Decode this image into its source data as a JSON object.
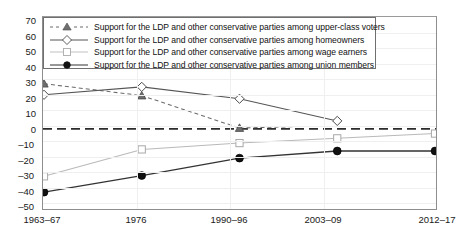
{
  "chart_data": {
    "type": "line",
    "title": "",
    "subtitle": "",
    "xlabel": "",
    "ylabel": "",
    "categories": [
      "1963–67",
      "1976",
      "1990–96",
      "2003–09",
      "2012–17"
    ],
    "ylim": [
      -50,
      70
    ],
    "ytick_labels": [
      "70",
      "60",
      "50",
      "40",
      "30",
      "20",
      "10",
      "0",
      "–10",
      "–20",
      "–30",
      "–40",
      "–50"
    ],
    "ytick_values": [
      70,
      60,
      50,
      40,
      30,
      20,
      10,
      0,
      -10,
      -20,
      -30,
      -40,
      -50
    ],
    "grid": true,
    "legend_position": "top-left",
    "zero_reference_line": 0,
    "series": [
      {
        "name": "Support for the LDP and other conservative parties among upper-class voters",
        "marker": "triangle-filled-gray",
        "line_style": "dashed",
        "color": "#6b6b6b",
        "values": [
          28.5,
          21,
          0.5,
          null,
          null
        ]
      },
      {
        "name": "Support for the LDP and other conservative parties among homeowners",
        "marker": "diamond-open",
        "line_style": "solid",
        "color": "#555555",
        "values": [
          21.5,
          26.5,
          19,
          5,
          null
        ]
      },
      {
        "name": "Support for the LDP and other conservative parties among wage earners",
        "marker": "square-open",
        "line_style": "solid",
        "color": "#b9b9b9",
        "values": [
          -30,
          -13,
          -9,
          -6,
          -3
        ]
      },
      {
        "name": "Support for the LDP and other conservative parties among union members",
        "marker": "circle-filled",
        "line_style": "solid",
        "color": "#333333",
        "values": [
          -40,
          -29.5,
          -18.5,
          -14,
          -14
        ]
      }
    ]
  },
  "legend": {
    "items": [
      {
        "label": "Support for the LDP and other conservative parties among upper-class voters"
      },
      {
        "label": "Support for the LDP and other conservative parties among homeowners"
      },
      {
        "label": "Support for the LDP and other conservative parties among wage earners"
      },
      {
        "label": "Support for the LDP and other conservative parties among union members"
      }
    ]
  }
}
